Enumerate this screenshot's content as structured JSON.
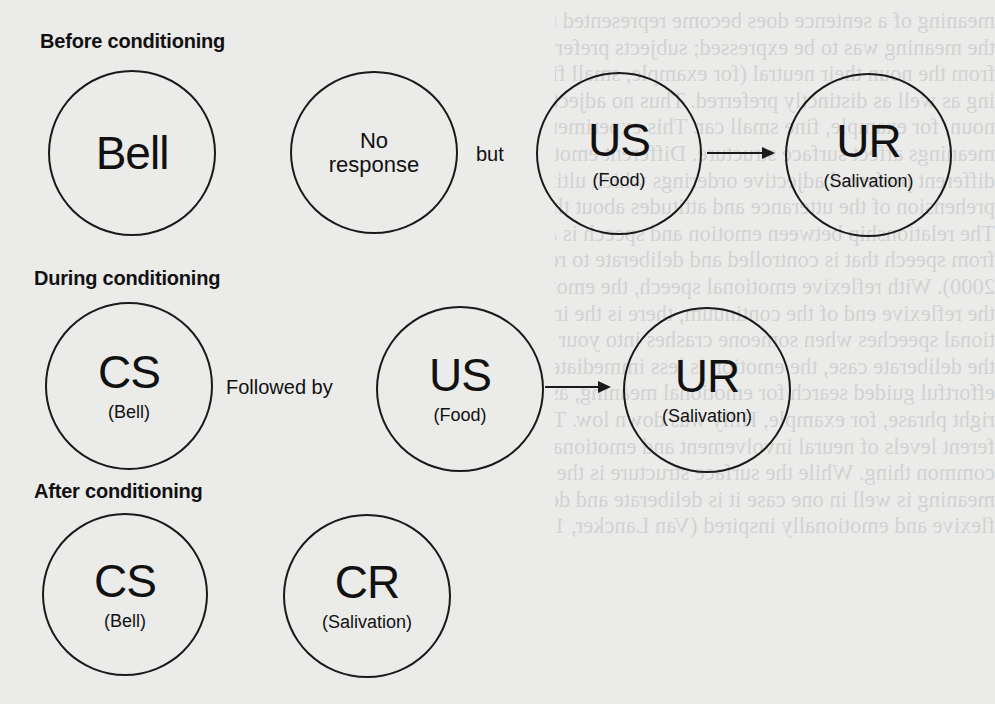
{
  "colors": {
    "paper": "#ebebea",
    "ink": "#1a1a1a"
  },
  "bleed_through_text": [
    "meaning of a sentence does become represented the",
    "the meaning was to be expressed; subjects preferred those adjectives to",
    "from the noun their neutral (for example, small fine car). When denot",
    "ing as well as distinctly preferred. Thus no adjective placed cl",
    "noun, for example, fine small car. This experiment demonstrated how",
    "meanings affect surface structure. Different emotional intentions are",
    "different preferred adjective orderings which ultimately affect the liste",
    "prehension of the utterance and attitudes about the speaker",
    "The relationship between emotion and speech is a matter of degree",
    "from speech that is controlled and deliberate to reflexive or automatic sp",
    "2000). With reflexive emotional speech, the emotions and words are chem",
    "the reflexive end of the continuum, there is the involuntary production",
    "tional speeches when someone crashes into your car and you say damn",
    "the deliberate case, the emotion is less immediate and there is always",
    "effortful guided search for emotional meaning, as when a politician",
    "right phrase, for example, Hilly was down low. The point is that the",
    "ferent levels of neural involvement and emotionally motivating the",
    "common thing. While the surface structure is the same, the underlying",
    "meaning is well in one case it is deliberate and denotative but in the",
    "flexive and emotionally inspired (Van Lancker, 1987). How emotional"
  ],
  "diagram": {
    "title_implied": "Classical conditioning",
    "sections": [
      {
        "heading": "Before conditioning",
        "nodes": [
          {
            "id": "bell",
            "label": "Bell",
            "sublabel": ""
          },
          {
            "id": "no-response",
            "label": "No",
            "label_line2": "response",
            "sublabel": ""
          },
          {
            "id": "us",
            "label": "US",
            "sublabel": "(Food)"
          },
          {
            "id": "ur",
            "label": "UR",
            "sublabel": "(Salivation)"
          }
        ],
        "connectors": [
          {
            "from": "no-response",
            "to": "us",
            "type": "text",
            "label": "but"
          },
          {
            "from": "us",
            "to": "ur",
            "type": "arrow"
          }
        ]
      },
      {
        "heading": "During conditioning",
        "nodes": [
          {
            "id": "cs",
            "label": "CS",
            "sublabel": "(Bell)"
          },
          {
            "id": "us",
            "label": "US",
            "sublabel": "(Food)"
          },
          {
            "id": "ur",
            "label": "UR",
            "sublabel": "(Salivation)"
          }
        ],
        "connectors": [
          {
            "from": "cs",
            "to": "us",
            "type": "text",
            "label": "Followed by"
          },
          {
            "from": "us",
            "to": "ur",
            "type": "arrow"
          }
        ]
      },
      {
        "heading": "After conditioning",
        "nodes": [
          {
            "id": "cs",
            "label": "CS",
            "sublabel": "(Bell)"
          },
          {
            "id": "cr",
            "label": "CR",
            "sublabel": "(Salivation)"
          }
        ],
        "connectors": []
      }
    ]
  }
}
